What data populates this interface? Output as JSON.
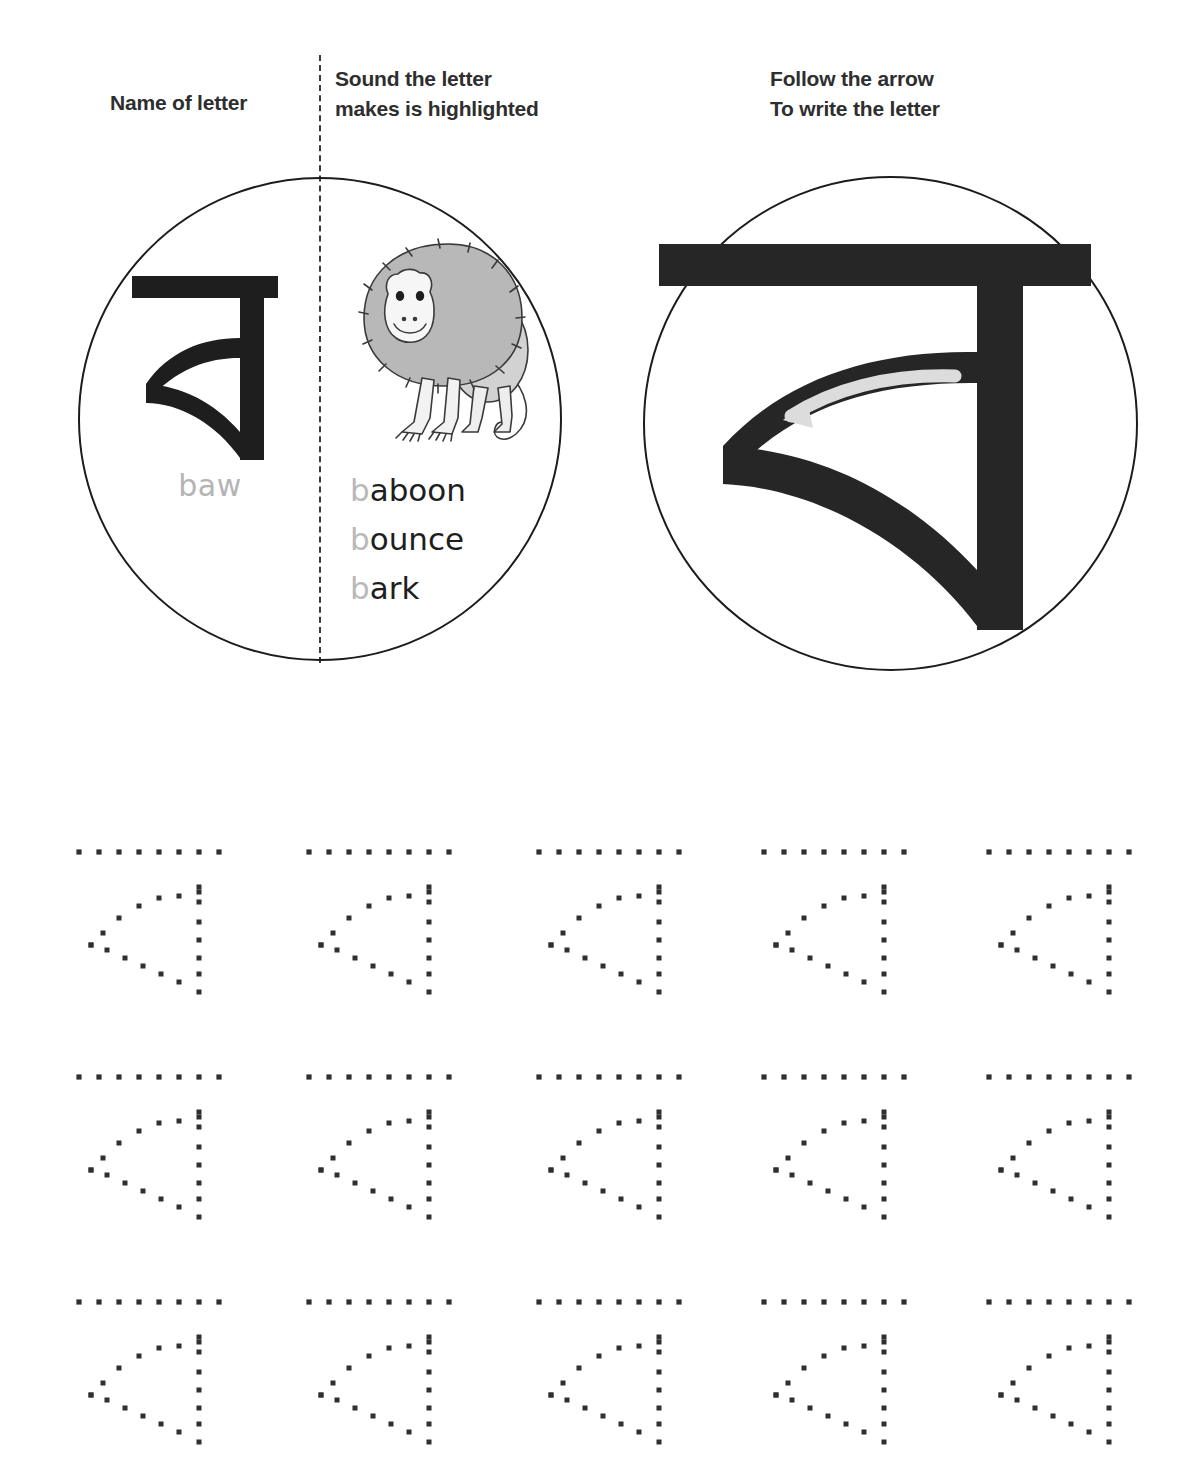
{
  "worksheet": {
    "title": "Bengali letter ba tracing worksheet",
    "headers": {
      "name_of_letter": "Name of letter",
      "sound_the_letter": "Sound the letter\nmakes is highlighted",
      "follow_the_arrow": "Follow the arrow\nTo write the letter"
    },
    "letter": {
      "glyph": "ব",
      "name": "baw",
      "script": "Bengali"
    },
    "illustration": {
      "icon": "baboon-icon",
      "subject": "baboon"
    },
    "words": [
      {
        "highlight": "b",
        "rest": "aboon"
      },
      {
        "highlight": "b",
        "rest": "ounce"
      },
      {
        "highlight": "b",
        "rest": "ark"
      }
    ],
    "arrow": {
      "icon": "stroke-direction-arrow-icon",
      "label": "stroke direction arrow"
    },
    "tracing": {
      "rows": 3,
      "columns": 5,
      "total": 15,
      "row_tops": [
        20,
        245,
        470
      ],
      "column_lefts": [
        75,
        305,
        535,
        760,
        985
      ]
    },
    "colors": {
      "ink": "#1e1e1e",
      "outline": "#1c1c1c",
      "muted": "#b9b9b9",
      "arrow": "#d8d8d8",
      "fur": "#b8b8b8",
      "skin": "#efefef",
      "dot": "#2f2f2f"
    }
  }
}
